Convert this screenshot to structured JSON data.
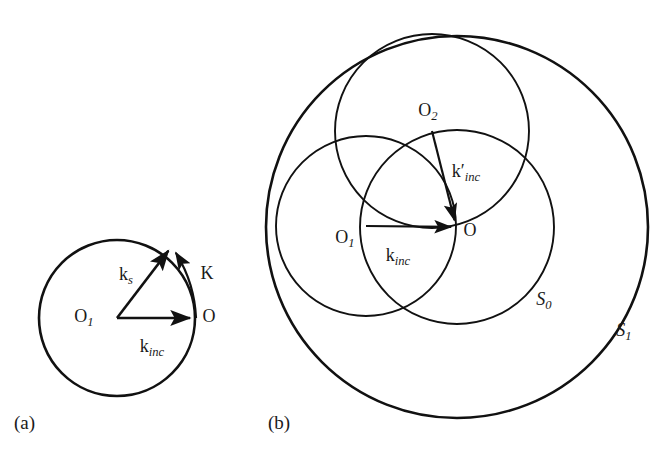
{
  "figure": {
    "type": "geometry-diagram",
    "background_color": "#ffffff",
    "stroke_color": "#111111",
    "text_color": "#1a1a1a"
  },
  "panels": [
    {
      "id": "a",
      "tag": "(a)",
      "description": "Ewald sphere construction with incident wavevector, scattered wavevector and scattering vector",
      "circles": [
        {
          "name": "ewald-circle",
          "cx": 117,
          "cy": 318,
          "r": 78,
          "stroke_width": 2.6
        }
      ],
      "points": [
        {
          "name": "O1",
          "label": "O",
          "sub": "1",
          "x": 117,
          "y": 318,
          "label_x": 84,
          "label_y": 318
        },
        {
          "name": "O",
          "label": "O",
          "sub": "",
          "x": 196,
          "y": 318,
          "label_x": 209,
          "label_y": 318
        }
      ],
      "vectors": [
        {
          "name": "k-inc",
          "label": "k",
          "sub": "inc",
          "from_x": 117,
          "from_y": 318,
          "to_x": 196,
          "to_y": 318,
          "label_x": 152,
          "label_y": 348,
          "curved": false
        },
        {
          "name": "k-s",
          "label": "k",
          "sub": "s",
          "from_x": 117,
          "from_y": 318,
          "to_x": 172,
          "to_y": 246,
          "label_x": 126,
          "label_y": 276,
          "curved": false
        },
        {
          "name": "K",
          "label": "K",
          "sub": "",
          "from_x": 196,
          "from_y": 318,
          "to_x": 174,
          "to_y": 247,
          "label_x": 207,
          "label_y": 275,
          "curved": true
        }
      ]
    },
    {
      "id": "b",
      "tag": "(b)",
      "description": "Three overlapping spheres S0, S1 with centres O, O1, O2 and incident wavevectors",
      "circles": [
        {
          "name": "S1-outer-sphere",
          "cx": 457,
          "cy": 227,
          "r": 191,
          "stroke_width": 2.6
        },
        {
          "name": "S0-sphere",
          "cx": 457,
          "cy": 227,
          "r": 97,
          "stroke_width": 1.9
        },
        {
          "name": "O1-sphere",
          "cx": 366,
          "cy": 226,
          "r": 90,
          "stroke_width": 1.9
        },
        {
          "name": "O2-sphere",
          "cx": 432,
          "cy": 131,
          "r": 97,
          "stroke_width": 1.9
        }
      ],
      "points": [
        {
          "name": "O1",
          "label": "O",
          "sub": "1",
          "x": 366,
          "y": 226,
          "label_x": 345,
          "label_y": 239
        },
        {
          "name": "O2",
          "label": "O",
          "sub": "2",
          "x": 432,
          "y": 131,
          "label_x": 428,
          "label_y": 112
        },
        {
          "name": "O",
          "label": "O",
          "sub": "",
          "x": 457,
          "y": 227,
          "label_x": 470,
          "label_y": 232
        }
      ],
      "vectors": [
        {
          "name": "k-inc",
          "label": "k",
          "sub": "inc",
          "from_x": 366,
          "from_y": 226,
          "to_x": 457,
          "to_y": 227,
          "label_x": 398,
          "label_y": 257,
          "curved": false
        },
        {
          "name": "k-prime-inc",
          "label": "k′",
          "sub": "inc",
          "from_x": 432,
          "from_y": 131,
          "to_x": 456,
          "to_y": 226,
          "label_x": 466,
          "label_y": 173,
          "curved": false
        }
      ],
      "surface_labels": [
        {
          "name": "S0",
          "label": "S",
          "sub": "0",
          "x": 544,
          "y": 301
        },
        {
          "name": "S1",
          "label": "S",
          "sub": "1",
          "x": 624,
          "y": 332
        }
      ]
    }
  ],
  "panel_tags": [
    {
      "name": "panel-tag-a",
      "text": "(a)",
      "x": 14,
      "y": 425
    },
    {
      "name": "panel-tag-b",
      "text": "(b)",
      "x": 268,
      "y": 425
    }
  ]
}
